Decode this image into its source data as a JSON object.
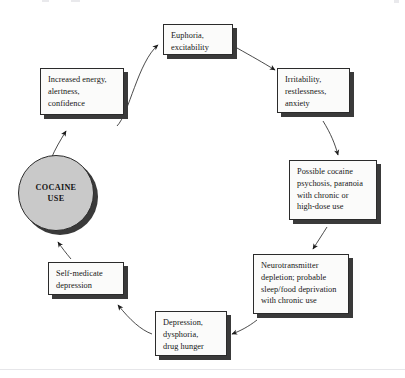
{
  "diagram": {
    "type": "cycle-flowchart",
    "hub": {
      "label": "COCAINE\nUSE",
      "shape": "circle",
      "fill": "#c9c9c9",
      "border": "#2b2b2b"
    },
    "node_style": {
      "fill": "#fbfbfa",
      "border": "#2b2b2b",
      "shadow": "#3a3a3a",
      "text": "#161616"
    },
    "nodes": [
      {
        "id": "euphoria",
        "label": "Euphoria,\nexcitability",
        "x": 163,
        "y": 24,
        "w": 70,
        "h": 31
      },
      {
        "id": "irritability",
        "label": "Irritability,\nrestlessness,\nanxiety",
        "x": 277,
        "y": 68,
        "w": 73,
        "h": 45
      },
      {
        "id": "psychosis",
        "label": "Possible cocaine\npsychosis, paranoia\nwith chronic or\nhigh-dose use",
        "x": 289,
        "y": 160,
        "w": 88,
        "h": 60
      },
      {
        "id": "neurotransmitter",
        "label": "Neurotransmitter\ndepletion; probable\nsleep/food deprivation\nwith chronic use",
        "x": 253,
        "y": 254,
        "w": 96,
        "h": 60
      },
      {
        "id": "depression",
        "label": "Depression,\ndysphoria,\ndrug hunger",
        "x": 155,
        "y": 311,
        "w": 72,
        "h": 45
      },
      {
        "id": "self-medicate",
        "label": "Self-medicate\ndepression",
        "x": 48,
        "y": 262,
        "w": 76,
        "h": 33
      },
      {
        "id": "increased-energy",
        "label": "Increased energy,\nalertness,\nconfidence",
        "x": 40,
        "y": 68,
        "w": 84,
        "h": 47
      }
    ],
    "arrows": [
      {
        "id": "arrow-energy-to-euphoria",
        "from": "increased-energy",
        "to": "euphoria"
      },
      {
        "id": "arrow-euphoria-to-irritability",
        "from": "euphoria",
        "to": "irritability"
      },
      {
        "id": "arrow-irritability-to-psychosis",
        "from": "irritability",
        "to": "psychosis"
      },
      {
        "id": "arrow-psychosis-to-neurotransmitter",
        "from": "psychosis",
        "to": "neurotransmitter"
      },
      {
        "id": "arrow-neurotransmitter-to-depression",
        "from": "neurotransmitter",
        "to": "depression"
      },
      {
        "id": "arrow-depression-to-selfmedicate",
        "from": "depression",
        "to": "self-medicate"
      },
      {
        "id": "arrow-selfmedicate-to-hub",
        "from": "self-medicate",
        "to": "hub"
      },
      {
        "id": "arrow-hub-to-energy",
        "from": "hub",
        "to": "increased-energy"
      }
    ]
  }
}
